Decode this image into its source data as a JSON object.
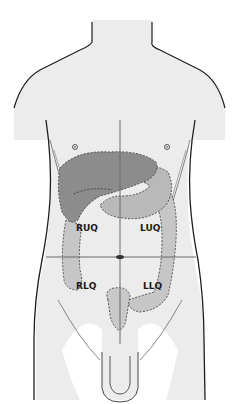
{
  "diagram": {
    "type": "anatomical-abdominal-quadrants",
    "colors": {
      "skin": "#ececec",
      "outline": "#1e1e1e",
      "liver": "#8c8c8c",
      "gallbladder_overlap": "#7a7a7a",
      "stomach": "#b9b9b9",
      "colon": "#c6c6c6",
      "bladder": "#c9c9c9",
      "quadrant_line": "#6a6a6a"
    },
    "quadrants": [
      {
        "id": "ruq",
        "label": "RUQ"
      },
      {
        "id": "luq",
        "label": "LUQ"
      },
      {
        "id": "rlq",
        "label": "RLQ"
      },
      {
        "id": "llq",
        "label": "LLQ"
      }
    ]
  }
}
